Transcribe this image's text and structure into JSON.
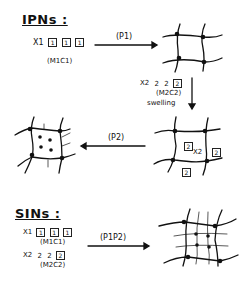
{
  "ipns": {
    "title": "IPNs :",
    "step1": {
      "multiplier": "X1",
      "monomer_label": "1",
      "composition": "(M1C1)",
      "process": "(P1)"
    },
    "step2": {
      "multiplier": "X2",
      "monomer_label": "2",
      "composition": "(M2C2)",
      "note": "swelling",
      "network_label": "X2",
      "process": "(P2)"
    }
  },
  "sins": {
    "title": "SINs :",
    "component1": {
      "multiplier": "X1",
      "monomer_label": "1",
      "composition": "(M1C1)"
    },
    "component2": {
      "multiplier": "X2",
      "monomer_label": "2",
      "composition": "(M2C2)"
    },
    "process": "(P1P2)"
  }
}
